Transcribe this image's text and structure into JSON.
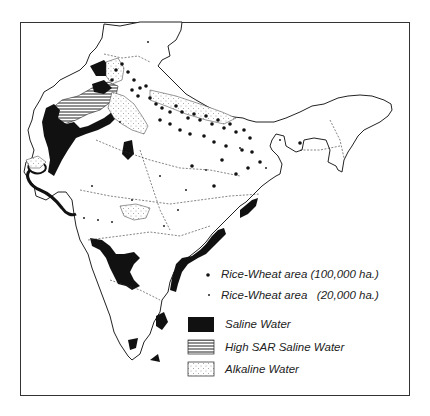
{
  "figure": {
    "type": "thematic map",
    "region": "India",
    "colors": {
      "saline": "#111111",
      "border": "#333333",
      "background": "#ffffff"
    }
  },
  "legend": {
    "items": [
      {
        "symbol": "large-dot",
        "label": "Rice-Wheat area (100,000 ha.)"
      },
      {
        "symbol": "small-dot",
        "label": "Rice-Wheat area   (20,000 ha.)"
      },
      {
        "symbol": "solid-black",
        "label": "Saline Water"
      },
      {
        "symbol": "horizontal-hatch",
        "label": "High SAR Saline Water"
      },
      {
        "symbol": "stipple",
        "label": "Alkaline Water"
      }
    ]
  }
}
